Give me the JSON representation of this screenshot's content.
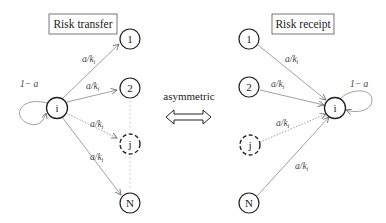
{
  "left_panel": {
    "title": "Risk transfer",
    "center_node": "i",
    "self_loop_label": "1− a",
    "nodes": [
      {
        "label": "1",
        "style": "solid"
      },
      {
        "label": "2",
        "style": "solid"
      },
      {
        "label": "j",
        "style": "dashed"
      },
      {
        "label": "N",
        "style": "solid"
      }
    ],
    "edges": [
      {
        "from": "i",
        "to": "1",
        "label": "a/k_i",
        "style": "solid"
      },
      {
        "from": "i",
        "to": "2",
        "label": "a/k_i",
        "style": "solid"
      },
      {
        "from": "i",
        "to": "j",
        "label": "a/k_i",
        "style": "dotted"
      },
      {
        "from": "i",
        "to": "N",
        "label": "a/k_i",
        "style": "solid"
      }
    ]
  },
  "middle": {
    "label": "asymmetric",
    "arrow": "double-arrow-icon"
  },
  "right_panel": {
    "title": "Risk receipt",
    "center_node": "i",
    "self_loop_label": "1− a",
    "nodes": [
      {
        "label": "1",
        "style": "solid"
      },
      {
        "label": "2",
        "style": "solid"
      },
      {
        "label": "j",
        "style": "dashed"
      },
      {
        "label": "N",
        "style": "solid"
      }
    ],
    "edges": [
      {
        "from": "1",
        "to": "i",
        "label": "a/k_i",
        "style": "solid"
      },
      {
        "from": "2",
        "to": "i",
        "label": "a/k_i",
        "style": "solid"
      },
      {
        "from": "j",
        "to": "i",
        "label": "a/k_i",
        "style": "dotted"
      },
      {
        "from": "N",
        "to": "i",
        "label": "a/k_i",
        "style": "solid"
      }
    ]
  },
  "edge_label_parts": {
    "num": "a/k",
    "sub": "i"
  }
}
